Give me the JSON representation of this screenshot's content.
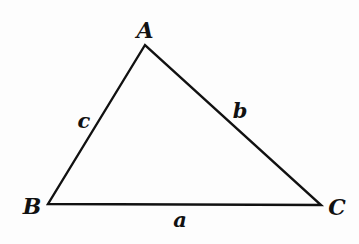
{
  "diagram": {
    "type": "triangle",
    "stroke_color": "#111111",
    "background": "#fdfdfd",
    "vertices": [
      {
        "id": "A",
        "label": "A",
        "x": 145,
        "y": 45,
        "label_x": 145,
        "label_y": 38
      },
      {
        "id": "B",
        "label": "B",
        "x": 48,
        "y": 204,
        "label_x": 32,
        "label_y": 214
      },
      {
        "id": "C",
        "label": "C",
        "x": 321,
        "y": 205,
        "label_x": 337,
        "label_y": 215
      }
    ],
    "sides": [
      {
        "id": "a",
        "label": "a",
        "from": "B",
        "to": "C",
        "label_x": 180,
        "label_y": 227
      },
      {
        "id": "b",
        "label": "b",
        "from": "A",
        "to": "C",
        "label_x": 240,
        "label_y": 118
      },
      {
        "id": "c",
        "label": "c",
        "from": "A",
        "to": "B",
        "label_x": 84,
        "label_y": 128
      }
    ]
  }
}
